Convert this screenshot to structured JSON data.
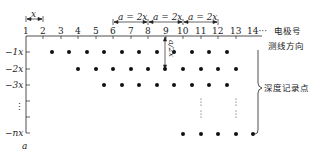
{
  "diagram": {
    "electrode_numbers": [
      "1",
      "2",
      "3",
      "4",
      "5",
      "6",
      "7",
      "8",
      "9",
      "10",
      "11",
      "12",
      "13",
      "14···"
    ],
    "electrode_axis_label": "电极号",
    "survey_direction_label": "测线方向",
    "depth_points_label": "深度记录点",
    "spacing_label_x": "x",
    "spacing_label_a1": "a = 2x",
    "spacing_label_a2": "a = 2x",
    "spacing_label_a3": "a = 2x",
    "vertical_spacing_label": "a/2x",
    "depth_labels": [
      "−1x",
      "−2x",
      "−3x",
      "⋮",
      "−nx"
    ],
    "depth_axis_label": "a",
    "colors": {
      "ink": "#222222",
      "background": "#ffffff"
    }
  }
}
